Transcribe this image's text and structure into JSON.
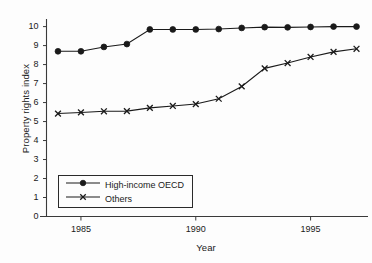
{
  "chart_data": {
    "type": "line",
    "title": "",
    "xlabel": "Year",
    "ylabel": "Property rights index",
    "xlim": [
      1983.5,
      1997.5
    ],
    "ylim": [
      0,
      10.4
    ],
    "xticks": [
      1985,
      1990,
      1995
    ],
    "yticks": [
      0,
      1,
      2,
      3,
      4,
      5,
      6,
      7,
      8,
      9,
      10
    ],
    "grid": false,
    "legend_position": "lower-left-inside",
    "x": [
      1984,
      1985,
      1986,
      1987,
      1988,
      1989,
      1990,
      1991,
      1992,
      1993,
      1994,
      1995,
      1996,
      1997
    ],
    "series": [
      {
        "name": "High-income OECD",
        "marker": "circle",
        "values": [
          8.7,
          8.7,
          8.93,
          9.08,
          9.85,
          9.85,
          9.85,
          9.87,
          9.93,
          9.97,
          9.96,
          9.98,
          10.0,
          10.0
        ]
      },
      {
        "name": "Others",
        "marker": "x",
        "values": [
          5.42,
          5.48,
          5.54,
          5.55,
          5.72,
          5.82,
          5.92,
          6.2,
          6.85,
          7.8,
          8.08,
          8.4,
          8.67,
          8.83
        ]
      }
    ]
  },
  "axes": {
    "y_title": "Property rights index",
    "x_title": "Year",
    "y_tick_labels": [
      "0",
      "1",
      "2",
      "3",
      "4",
      "5",
      "6",
      "7",
      "8",
      "9",
      "10"
    ],
    "x_tick_labels": [
      "1985",
      "1990",
      "1995"
    ]
  },
  "legend": {
    "entries": [
      {
        "label": "High-income OECD",
        "marker": "circle"
      },
      {
        "label": "Others",
        "marker": "x"
      }
    ]
  },
  "colors": {
    "line": "#1a1a1a",
    "axis": "#3a3a3a",
    "background": "#fdfdfd",
    "legend_border": "#2a2a2a"
  }
}
